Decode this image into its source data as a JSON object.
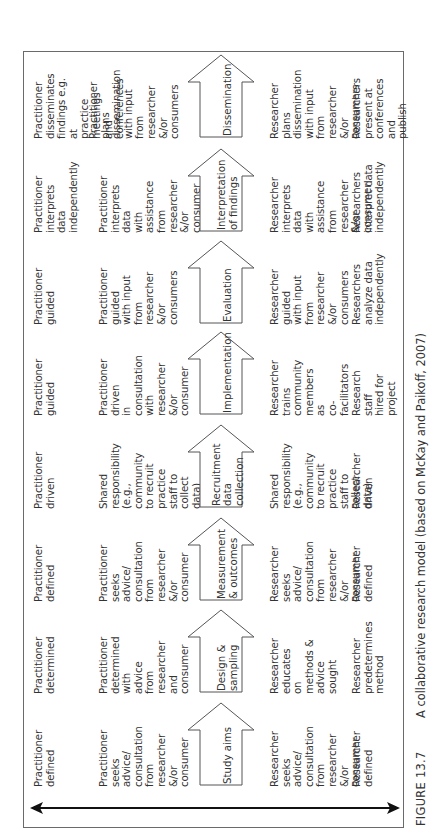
{
  "figure": {
    "number": "FIGURE 13.7",
    "caption": "A collaborative research model (based on McKay and Paikoff, 2007)"
  },
  "axis": {
    "type": "double-headed-arrow",
    "orientation": "spans from practitioner rows to researcher rows"
  },
  "stages": [
    {
      "label": "Study aims",
      "practitioner_short": "Practitioner\ndefined",
      "practitioner_detail": "Practitioner\nseeks advice/\nconsultation from\nresearcher &/or\nconsumer",
      "researcher_detail": "Researcher\nseeks advice/\nconsultation from\nresearcher &/or\nconsumer",
      "researcher_short": "Researcher\ndefined"
    },
    {
      "label": "Design &\nsampling",
      "practitioner_short": "Practitioner\ndetermined",
      "practitioner_detail": "Practitioner\ndetermined with\nadvice from\nresearcher and\nconsumer",
      "researcher_detail": "Researcher\neducates on\nmethods & advice\nsought",
      "researcher_short": "Researcher\npredetermines\nmethod"
    },
    {
      "label": "Measurement\n& outcomes",
      "practitioner_short": "Practitioner\ndefined",
      "practitioner_detail": "Practitioner\nseeks advice/\nconsultation from\nresearcher &/or\nconsumer",
      "researcher_detail": "Researcher\nseeks advice/\nconsultation from\nresearcher &/or\nconsumer",
      "researcher_short": "Researcher\ndefined"
    },
    {
      "label": "Recruitment\ndata collection",
      "practitioner_short": "Practitioner driven",
      "practitioner_detail": "Shared\nresponsibility\n(e.g., community\nto recruit practice\nstaff to collect\ndata)",
      "researcher_detail": "Shared\nresponsibility\n(e.g., community\nto recruit practice\nstaff to collect\ndata)",
      "researcher_short": "Researcher driven"
    },
    {
      "label": "Implementation",
      "practitioner_short": "Practitioner\nguided",
      "practitioner_detail": "Practitioner driven\nin consultation\nwith researcher\n&/or consumer",
      "researcher_detail": "Researcher\ntrains community\nmembers as\nco-facilitators",
      "researcher_short": "Research staff\nhired for project"
    },
    {
      "label": "Evaluation",
      "practitioner_short": "Practitioner\nguided",
      "practitioner_detail": "Practitioner\nguided with input\nfrom researcher\n&/or consumers",
      "researcher_detail": "Researcher\nguided with input\nfrom researcher\n&/or consumers",
      "researcher_short": "Researchers\nanalyze data\nindependently"
    },
    {
      "label": "Interpretation\nof findings",
      "practitioner_short": "Practitioner\ninterprets data\nindependently",
      "practitioner_detail": "Practitioner\ninterprets data\nwith assistance\nfrom researcher\n&/or consumer",
      "researcher_detail": "Researcher\ninterprets data\nwith assistance\nfrom researcher\n&/or consumer",
      "researcher_short": "Researchers\ninterpret data\nindependently"
    },
    {
      "label": "Dissemination",
      "practitioner_short": "Practitioner\ndisseminates\nfindings e.g. at\npractice meetings\nand conferences",
      "practitioner_detail": "Practitioner plans\ndissemination\nwith input from\nresearcher &/or\nconsumers",
      "researcher_detail": "Researcher plans\ndissemination\nwith input from\nresearcher &/or\nconsumers",
      "researcher_short": "Researchers\npresent at\nconferences and\npublish"
    }
  ],
  "colors": {
    "text": "#333333",
    "stroke": "#555555",
    "frame": "#6a6a6a",
    "axis_arrow": "#111111",
    "background": "#ffffff"
  }
}
